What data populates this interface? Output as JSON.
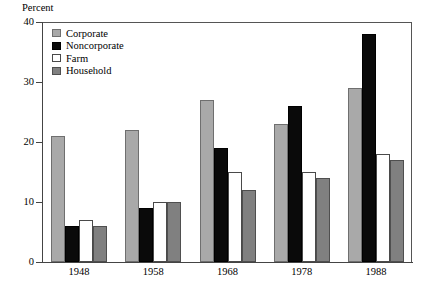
{
  "chart_data": {
    "type": "bar",
    "title": "",
    "subtitle": "",
    "xlabel": "",
    "ylabel": "Percent",
    "ylim": [
      0,
      40
    ],
    "yticks": [
      0,
      10,
      20,
      30,
      40
    ],
    "ytick_labels": [
      "0",
      "10",
      "20",
      "30",
      "40"
    ],
    "grid": false,
    "legend_position": "top-left",
    "categories": [
      "1948",
      "1958",
      "1968",
      "1978",
      "1988"
    ],
    "series": [
      {
        "name": "Corporate",
        "color": "#a9a9a9",
        "values": [
          21,
          22,
          27,
          23,
          29
        ]
      },
      {
        "name": "Noncorporate",
        "color": "#0a0a0a",
        "values": [
          6,
          9,
          19,
          26,
          38
        ]
      },
      {
        "name": "Farm",
        "color": "#ffffff",
        "values": [
          7,
          10,
          15,
          15,
          18
        ]
      },
      {
        "name": "Household",
        "color": "#808080",
        "values": [
          6,
          10,
          12,
          14,
          17
        ]
      }
    ]
  }
}
